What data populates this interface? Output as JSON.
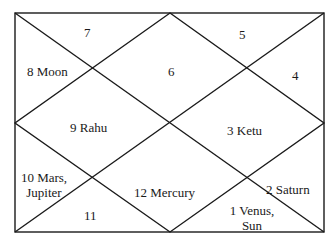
{
  "top_fragment": "",
  "chart": {
    "type": "north-indian-horoscope",
    "line_color": "#1a1a1a",
    "houses": [
      {
        "id": "house-7",
        "label": "7"
      },
      {
        "id": "house-5",
        "label": "5"
      },
      {
        "id": "house-8",
        "label": "8  Moon"
      },
      {
        "id": "house-6",
        "label": "6"
      },
      {
        "id": "house-4",
        "label": "4"
      },
      {
        "id": "house-9",
        "label": "9  Rahu"
      },
      {
        "id": "house-3",
        "label": "3  Ketu"
      },
      {
        "id": "house-10",
        "label_line1": "10  Mars,",
        "label_line2": "Jupiter"
      },
      {
        "id": "house-12",
        "label": "12    Mercury"
      },
      {
        "id": "house-2",
        "label": "2  Saturn"
      },
      {
        "id": "house-11",
        "label": "11"
      },
      {
        "id": "house-1",
        "label_line1": "1  Venus,",
        "label_line2": "Sun"
      }
    ]
  }
}
